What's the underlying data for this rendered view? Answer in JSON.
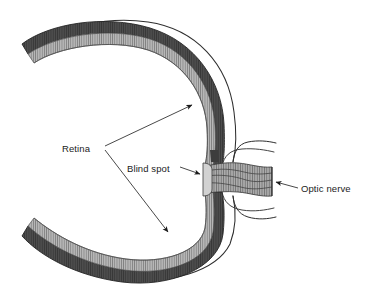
{
  "diagram": {
    "background_color": "#ffffff",
    "ink_color": "#1b1b1b",
    "labels": {
      "retina": "Retina",
      "blind_spot": "Blind spot",
      "optic_nerve": "Optic nerve"
    },
    "structures": {
      "sclera": {
        "name": "sclera-outline",
        "color": "#ffffff",
        "stroke": "#3a3a3a"
      },
      "choroid": {
        "name": "choroid-band",
        "color": "#4a4a4a"
      },
      "retina_layer": {
        "name": "retina-band",
        "color": "#b3b3b3"
      },
      "optic_nerve_body": {
        "name": "optic-nerve-band",
        "color": "#a8a8a8"
      },
      "vitreous": {
        "name": "vitreous-interior",
        "color": "#ffffff"
      }
    },
    "annotations": [
      {
        "label": "Retina",
        "arrows": 2,
        "target": "retina-band"
      },
      {
        "label": "Blind spot",
        "arrows": 1,
        "target": "optic-disc"
      },
      {
        "label": "Optic nerve",
        "arrows": 1,
        "target": "optic-nerve-band"
      }
    ]
  }
}
